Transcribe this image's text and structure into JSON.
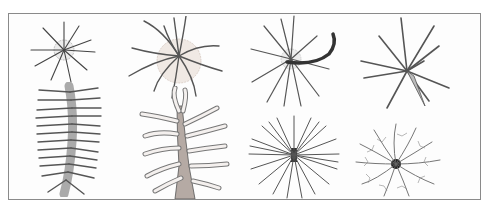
{
  "plate": {
    "description": "Illustration plate of eight radiolarian-like organisms",
    "border_color": "#8a8a8a",
    "figures": [
      {
        "id": "fig-1",
        "label": "small radial spined sphere",
        "row": 1,
        "col": 1
      },
      {
        "id": "fig-2",
        "label": "large radial spined sphere with halo",
        "row": 1,
        "col": 2
      },
      {
        "id": "fig-3",
        "label": "radial spines with curved dark spine",
        "row": 1,
        "col": 3
      },
      {
        "id": "fig-4",
        "label": "long-spined star form",
        "row": 1,
        "col": 4
      },
      {
        "id": "fig-5",
        "label": "elongated colonial body with many spines",
        "row": 2,
        "col": 1
      },
      {
        "id": "fig-6",
        "label": "branching stalk with finger-like processes",
        "row": 2,
        "col": 2
      },
      {
        "id": "fig-7",
        "label": "dense radial spine cluster",
        "row": 2,
        "col": 3
      },
      {
        "id": "fig-8",
        "label": "feathery branched cluster",
        "row": 2,
        "col": 4
      }
    ]
  }
}
